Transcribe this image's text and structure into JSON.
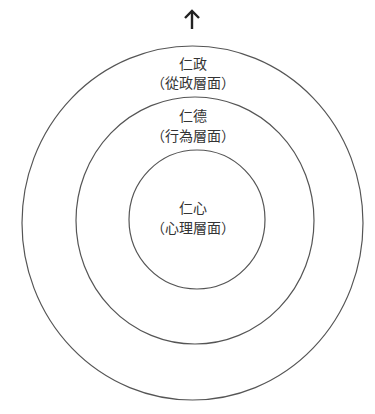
{
  "diagram": {
    "type": "concentric-circles",
    "top_text_cutoff": "仁政（政治層面）",
    "arrow": "up-arrow",
    "stroke_color": "#555555",
    "text_color": "#333333",
    "rings": [
      {
        "id": "outer",
        "title": "仁政",
        "subtitle": "（從政層面）"
      },
      {
        "id": "middle",
        "title": "仁德",
        "subtitle": "（行為層面）"
      },
      {
        "id": "inner",
        "title": "仁心",
        "subtitle": "（心理層面）"
      }
    ]
  }
}
